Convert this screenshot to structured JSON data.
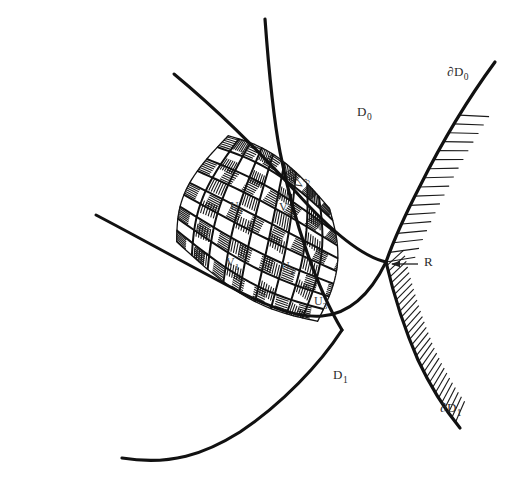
{
  "figure": {
    "width": 510,
    "height": 490,
    "background_color": "#ffffff",
    "ink_color": "#111111"
  },
  "regions": [
    {
      "id": "D0",
      "base": "D",
      "sub": "0",
      "x": 357,
      "y": 116,
      "note": "upper region label"
    },
    {
      "id": "D1",
      "base": "D",
      "sub": "1",
      "x": 333,
      "y": 379,
      "note": "lower region label"
    }
  ],
  "boundaries": [
    {
      "id": "dD0",
      "base": "∂D",
      "sub": "0",
      "label_x": 447,
      "label_y": 76,
      "path": "M 495 62 C 470 96, 443 140, 420 186 C 403 219, 392 245, 386 262",
      "stroke_width": 3.2,
      "hatch_side": "left",
      "hatch_count": 17,
      "hatch_length": 26,
      "hatch_start": 0.28,
      "hatch_end": 1.0
    },
    {
      "id": "dD1",
      "base": "∂D",
      "sub": "1",
      "label_x": 440,
      "label_y": 412,
      "path": "M 386 262 C 393 292, 404 328, 418 360 C 432 390, 447 412, 460 428",
      "stroke_width": 3.2,
      "hatch_side": "left",
      "hatch_count": 30,
      "hatch_length": 20,
      "hatch_start": 0.02,
      "hatch_end": 0.96
    }
  ],
  "crossing_point": {
    "id": "R",
    "label": "R",
    "x": 386,
    "y": 262,
    "label_x": 424,
    "label_y": 266,
    "leader_from_x": 418,
    "leader_from_y": 264,
    "leader_to_x": 392,
    "leader_to_y": 264,
    "arrow": true
  },
  "long_arcs": [
    {
      "id": "arc-upper-right",
      "note": "arc sweeping from top down through lattice to lower right",
      "path": "M 265 19 C 268 60, 272 110, 280 152 C 294 224, 318 290, 342 330",
      "stroke_width": 3.2
    },
    {
      "id": "arc-upper-left",
      "note": "arc from upper-left crossing down to lower area",
      "path": "M 174 74 C 215 108, 258 150, 296 192 C 330 230, 360 256, 386 262",
      "stroke_width": 3.0
    },
    {
      "id": "arc-lower-left",
      "note": "arc from left mid crossing to right",
      "path": "M 96 215 C 140 238, 190 266, 240 292 C 300 322, 350 336, 386 262",
      "stroke_width": 3.0
    },
    {
      "id": "arc-bottom",
      "note": "arc sweeping from lattice bottom to lower-left",
      "path": "M 342 330 C 320 364, 282 404, 240 432 C 205 454, 170 466, 122 458",
      "stroke_width": 3.2
    }
  ],
  "lattice": {
    "note": "two families of hatched parallel strips forming a curvilinear quadrilateral grid",
    "corner_top_left": {
      "x": 228,
      "y": 135
    },
    "corner_top_right": {
      "x": 330,
      "y": 208
    },
    "corner_bottom_right": {
      "x": 318,
      "y": 322
    },
    "corner_bottom_left": {
      "x": 176,
      "y": 242
    },
    "family_u": {
      "name": "U-strips",
      "direction": "lower-left to upper-right",
      "strip_count": 9,
      "hatched_indices": [
        0,
        2,
        4,
        6,
        8
      ]
    },
    "family_v": {
      "name": "V-strips",
      "direction": "upper-left to lower-right",
      "strip_count": 9,
      "hatched_indices": [
        1,
        3,
        5,
        7
      ]
    }
  },
  "cell_labels": [
    {
      "id": "U1",
      "base": "U",
      "sub": "1",
      "x": 230,
      "y": 210,
      "rotate": 0
    },
    {
      "id": "V2",
      "base": "V",
      "sub": "2",
      "x": 279,
      "y": 211,
      "rotate": 0
    },
    {
      "id": "V3",
      "base": "V",
      "sub": "3",
      "x": 300,
      "y": 190,
      "rotate": -58
    },
    {
      "id": "V1",
      "base": "V",
      "sub": "1",
      "x": 226,
      "y": 266,
      "rotate": 0
    },
    {
      "id": "U2",
      "base": "U",
      "sub": "2",
      "x": 281,
      "y": 270,
      "rotate": 0
    },
    {
      "id": "U3",
      "base": "U",
      "sub": "3",
      "x": 314,
      "y": 305,
      "rotate": 0
    }
  ]
}
